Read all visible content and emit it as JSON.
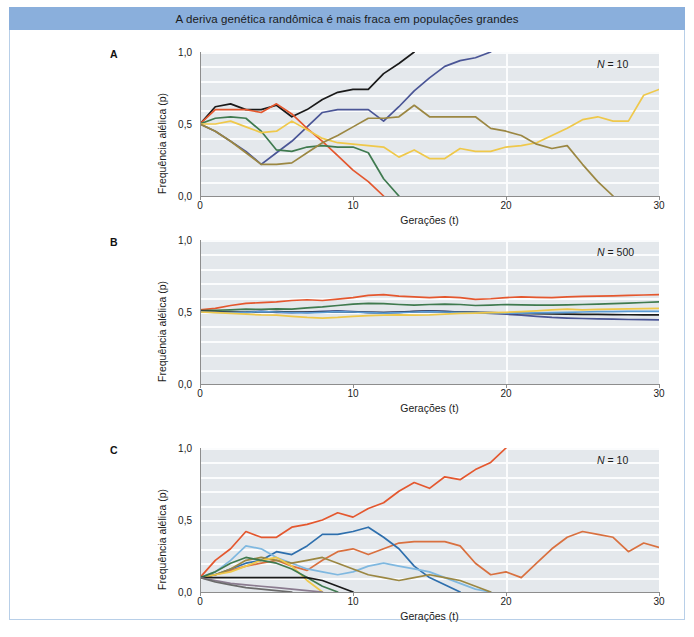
{
  "figure": {
    "title": "A deriva genética randômica é mais fraca em populações grandes",
    "title_bar_color": "#8aafdc",
    "frame_color": "#b8cfe8",
    "plot_background": "#e4e8ec",
    "gridline_color": "#fbfcfd"
  },
  "axis": {
    "xlabel": "Gerações (t)",
    "ylabel": "Frequência alélica (p)",
    "x_ticks": [
      "0",
      "10",
      "20",
      "30"
    ],
    "y_ticks": [
      "1,0",
      "0,5",
      "0,0"
    ],
    "xlim": [
      0,
      30
    ],
    "ylim": [
      0,
      1
    ]
  },
  "panels": [
    {
      "letter": "A",
      "n_label_prefix": "N",
      "n_label_eq": " = ",
      "n_label_value": "10",
      "start_frequency": 0.5
    },
    {
      "letter": "B",
      "n_label_prefix": "N",
      "n_label_eq": " = ",
      "n_label_value": "500",
      "start_frequency": 0.5
    },
    {
      "letter": "C",
      "n_label_prefix": "N",
      "n_label_eq": " = ",
      "n_label_value": "10",
      "start_frequency": 0.1
    }
  ],
  "chart_data": [
    {
      "type": "line",
      "panel": "A",
      "title": "",
      "xlabel": "Gerações (t)",
      "ylabel": "Frequência alélica (p)",
      "xlim": [
        0,
        30
      ],
      "ylim": [
        0,
        1
      ],
      "grid": true,
      "annotation": "N = 10",
      "x": [
        0,
        1,
        2,
        3,
        4,
        5,
        6,
        7,
        8,
        9,
        10,
        11,
        12,
        13,
        14,
        15,
        16,
        17,
        18,
        19,
        20,
        21,
        22,
        23,
        24,
        25,
        26,
        27,
        28,
        29,
        30
      ],
      "series": [
        {
          "name": "replicate-1",
          "color": "#1a1a1a",
          "values": [
            0.5,
            0.62,
            0.64,
            0.6,
            0.6,
            0.63,
            0.55,
            0.6,
            0.67,
            0.72,
            0.74,
            0.74,
            0.85,
            0.92,
            1.0,
            1.0,
            1.0,
            1.0,
            1.0,
            1.0,
            1.0,
            1.0,
            1.0,
            1.0,
            1.0,
            1.0,
            1.0,
            1.0,
            1.0,
            1.0,
            1.0
          ]
        },
        {
          "name": "replicate-2",
          "color": "#4a5596",
          "values": [
            0.5,
            0.45,
            0.38,
            0.31,
            0.22,
            0.3,
            0.38,
            0.48,
            0.58,
            0.6,
            0.6,
            0.6,
            0.52,
            0.62,
            0.73,
            0.82,
            0.9,
            0.94,
            0.96,
            1.0,
            1.0,
            1.0,
            1.0,
            1.0,
            1.0,
            1.0,
            1.0,
            1.0,
            1.0,
            1.0,
            1.0
          ]
        },
        {
          "name": "replicate-3",
          "color": "#e4572e",
          "values": [
            0.5,
            0.6,
            0.6,
            0.6,
            0.58,
            0.64,
            0.57,
            0.47,
            0.38,
            0.28,
            0.18,
            0.1,
            0.0,
            0.0,
            0.0,
            0.0,
            0.0,
            0.0,
            0.0,
            0.0,
            0.0,
            0.0,
            0.0,
            0.0,
            0.0,
            0.0,
            0.0,
            0.0,
            0.0,
            0.0,
            0.0
          ]
        },
        {
          "name": "replicate-4",
          "color": "#3f7a4f",
          "values": [
            0.5,
            0.54,
            0.55,
            0.54,
            0.45,
            0.32,
            0.31,
            0.34,
            0.35,
            0.34,
            0.34,
            0.3,
            0.12,
            0.0,
            0.0,
            0.0,
            0.0,
            0.0,
            0.0,
            0.0,
            0.0,
            0.0,
            0.0,
            0.0,
            0.0,
            0.0,
            0.0,
            0.0,
            0.0,
            0.0,
            0.0
          ]
        },
        {
          "name": "replicate-5",
          "color": "#efc84a",
          "values": [
            0.5,
            0.5,
            0.52,
            0.48,
            0.44,
            0.45,
            0.52,
            0.46,
            0.4,
            0.37,
            0.36,
            0.35,
            0.34,
            0.27,
            0.32,
            0.26,
            0.26,
            0.33,
            0.31,
            0.31,
            0.34,
            0.35,
            0.37,
            0.42,
            0.47,
            0.53,
            0.55,
            0.52,
            0.52,
            0.7,
            0.74
          ]
        },
        {
          "name": "replicate-6",
          "color": "#9b8742",
          "values": [
            0.5,
            0.45,
            0.38,
            0.3,
            0.22,
            0.22,
            0.23,
            0.3,
            0.37,
            0.42,
            0.48,
            0.54,
            0.54,
            0.55,
            0.63,
            0.55,
            0.55,
            0.55,
            0.55,
            0.47,
            0.45,
            0.42,
            0.36,
            0.33,
            0.35,
            0.22,
            0.1,
            0.0,
            0.0,
            0.0,
            0.0
          ]
        }
      ]
    },
    {
      "type": "line",
      "panel": "B",
      "title": "",
      "xlabel": "Gerações (t)",
      "ylabel": "Frequência alélica (p)",
      "xlim": [
        0,
        30
      ],
      "ylim": [
        0,
        1
      ],
      "grid": true,
      "annotation": "N = 500",
      "x": [
        0,
        1,
        2,
        3,
        4,
        5,
        6,
        7,
        8,
        9,
        10,
        11,
        12,
        13,
        14,
        15,
        16,
        17,
        18,
        19,
        20,
        21,
        22,
        23,
        24,
        25,
        26,
        27,
        28,
        29,
        30
      ],
      "series": [
        {
          "name": "replicate-1",
          "color": "#e4572e",
          "values": [
            0.515,
            0.525,
            0.545,
            0.56,
            0.565,
            0.57,
            0.58,
            0.585,
            0.58,
            0.59,
            0.6,
            0.615,
            0.62,
            0.61,
            0.605,
            0.6,
            0.605,
            0.6,
            0.588,
            0.592,
            0.6,
            0.605,
            0.602,
            0.6,
            0.605,
            0.608,
            0.61,
            0.612,
            0.615,
            0.618,
            0.62
          ]
        },
        {
          "name": "replicate-2",
          "color": "#3f7a4f",
          "values": [
            0.51,
            0.512,
            0.515,
            0.52,
            0.518,
            0.522,
            0.52,
            0.528,
            0.535,
            0.545,
            0.555,
            0.56,
            0.558,
            0.552,
            0.548,
            0.552,
            0.555,
            0.552,
            0.545,
            0.548,
            0.552,
            0.55,
            0.548,
            0.548,
            0.55,
            0.552,
            0.555,
            0.558,
            0.562,
            0.566,
            0.57
          ]
        },
        {
          "name": "replicate-3",
          "color": "#4a5596",
          "values": [
            0.505,
            0.5,
            0.498,
            0.5,
            0.505,
            0.498,
            0.495,
            0.5,
            0.505,
            0.508,
            0.502,
            0.498,
            0.495,
            0.5,
            0.505,
            0.508,
            0.505,
            0.5,
            0.495,
            0.49,
            0.485,
            0.478,
            0.47,
            0.462,
            0.458,
            0.455,
            0.452,
            0.45,
            0.448,
            0.447,
            0.446
          ]
        },
        {
          "name": "replicate-4",
          "color": "#1a1a1a",
          "values": [
            0.505,
            0.502,
            0.5,
            0.498,
            0.5,
            0.503,
            0.5,
            0.498,
            0.5,
            0.502,
            0.5,
            0.498,
            0.496,
            0.498,
            0.502,
            0.505,
            0.503,
            0.5,
            0.498,
            0.495,
            0.492,
            0.49,
            0.488,
            0.486,
            0.485,
            0.484,
            0.483,
            0.482,
            0.481,
            0.48,
            0.48
          ]
        },
        {
          "name": "replicate-5",
          "color": "#5b9bd5",
          "values": [
            0.5,
            0.498,
            0.496,
            0.498,
            0.502,
            0.5,
            0.496,
            0.494,
            0.498,
            0.502,
            0.5,
            0.496,
            0.492,
            0.495,
            0.5,
            0.502,
            0.5,
            0.498,
            0.496,
            0.494,
            0.492,
            0.492,
            0.494,
            0.496,
            0.498,
            0.5,
            0.502,
            0.503,
            0.504,
            0.505,
            0.505
          ]
        },
        {
          "name": "replicate-6",
          "color": "#efc84a",
          "values": [
            0.5,
            0.495,
            0.49,
            0.485,
            0.48,
            0.478,
            0.47,
            0.462,
            0.458,
            0.462,
            0.47,
            0.475,
            0.478,
            0.48,
            0.478,
            0.48,
            0.485,
            0.49,
            0.492,
            0.495,
            0.498,
            0.502,
            0.508,
            0.515,
            0.52,
            0.515,
            0.518,
            0.52,
            0.522,
            0.524,
            0.525
          ]
        }
      ]
    },
    {
      "type": "line",
      "panel": "C",
      "title": "",
      "xlabel": "Gerações (t)",
      "ylabel": "Frequência alélica (p)",
      "xlim": [
        0,
        30
      ],
      "ylim": [
        0,
        1
      ],
      "grid": true,
      "annotation": "N = 10",
      "x": [
        0,
        1,
        2,
        3,
        4,
        5,
        6,
        7,
        8,
        9,
        10,
        11,
        12,
        13,
        14,
        15,
        16,
        17,
        18,
        19,
        20,
        21,
        22,
        23,
        24,
        25,
        26,
        27,
        28,
        29,
        30
      ],
      "series": [
        {
          "name": "replicate-1",
          "color": "#e4572e",
          "values": [
            0.1,
            0.22,
            0.3,
            0.42,
            0.38,
            0.38,
            0.45,
            0.47,
            0.5,
            0.55,
            0.52,
            0.58,
            0.62,
            0.7,
            0.76,
            0.72,
            0.8,
            0.78,
            0.85,
            0.9,
            1.0,
            1.0,
            1.0,
            1.0,
            1.0,
            1.0,
            1.0,
            1.0,
            1.0,
            1.0,
            1.0
          ]
        },
        {
          "name": "replicate-2",
          "color": "#d9703f",
          "values": [
            0.1,
            0.12,
            0.15,
            0.18,
            0.2,
            0.22,
            0.18,
            0.15,
            0.22,
            0.28,
            0.3,
            0.26,
            0.3,
            0.34,
            0.35,
            0.35,
            0.35,
            0.32,
            0.2,
            0.12,
            0.14,
            0.1,
            0.2,
            0.3,
            0.38,
            0.42,
            0.4,
            0.38,
            0.28,
            0.34,
            0.31
          ]
        },
        {
          "name": "replicate-3",
          "color": "#2e6fad",
          "values": [
            0.1,
            0.12,
            0.16,
            0.2,
            0.22,
            0.28,
            0.26,
            0.32,
            0.4,
            0.4,
            0.42,
            0.45,
            0.38,
            0.3,
            0.18,
            0.1,
            0.05,
            0.0,
            0.0,
            0.0,
            0.0,
            0.0,
            0.0,
            0.0,
            0.0,
            0.0,
            0.0,
            0.0,
            0.0,
            0.0,
            0.0
          ]
        },
        {
          "name": "replicate-4",
          "color": "#7fb8e0",
          "values": [
            0.1,
            0.14,
            0.22,
            0.32,
            0.3,
            0.24,
            0.2,
            0.16,
            0.14,
            0.12,
            0.14,
            0.18,
            0.2,
            0.18,
            0.16,
            0.14,
            0.1,
            0.06,
            0.02,
            0.0,
            0.0,
            0.0,
            0.0,
            0.0,
            0.0,
            0.0,
            0.0,
            0.0,
            0.0,
            0.0,
            0.0
          ]
        },
        {
          "name": "replicate-5",
          "color": "#9b8742",
          "values": [
            0.1,
            0.12,
            0.16,
            0.22,
            0.24,
            0.22,
            0.2,
            0.22,
            0.24,
            0.2,
            0.16,
            0.12,
            0.1,
            0.08,
            0.1,
            0.12,
            0.1,
            0.08,
            0.04,
            0.0,
            0.0,
            0.0,
            0.0,
            0.0,
            0.0,
            0.0,
            0.0,
            0.0,
            0.0,
            0.0,
            0.0
          ]
        },
        {
          "name": "replicate-6",
          "color": "#efc84a",
          "values": [
            0.1,
            0.12,
            0.14,
            0.18,
            0.22,
            0.24,
            0.18,
            0.08,
            0.0,
            0.0,
            0.0,
            0.0,
            0.0,
            0.0,
            0.0,
            0.0,
            0.0,
            0.0,
            0.0,
            0.0,
            0.0,
            0.0,
            0.0,
            0.0,
            0.0,
            0.0,
            0.0,
            0.0,
            0.0,
            0.0,
            0.0
          ]
        },
        {
          "name": "replicate-7",
          "color": "#3f7a4f",
          "values": [
            0.1,
            0.14,
            0.2,
            0.24,
            0.22,
            0.2,
            0.16,
            0.1,
            0.04,
            0.0,
            0.0,
            0.0,
            0.0,
            0.0,
            0.0,
            0.0,
            0.0,
            0.0,
            0.0,
            0.0,
            0.0,
            0.0,
            0.0,
            0.0,
            0.0,
            0.0,
            0.0,
            0.0,
            0.0,
            0.0,
            0.0
          ]
        },
        {
          "name": "replicate-8",
          "color": "#1a1a1a",
          "values": [
            0.1,
            0.1,
            0.1,
            0.1,
            0.1,
            0.1,
            0.1,
            0.1,
            0.08,
            0.04,
            0.0,
            0.0,
            0.0,
            0.0,
            0.0,
            0.0,
            0.0,
            0.0,
            0.0,
            0.0,
            0.0,
            0.0,
            0.0,
            0.0,
            0.0,
            0.0,
            0.0,
            0.0,
            0.0,
            0.0,
            0.0
          ]
        },
        {
          "name": "replicate-9",
          "color": "#8a7b8f",
          "values": [
            0.1,
            0.08,
            0.06,
            0.05,
            0.04,
            0.03,
            0.02,
            0.01,
            0.0,
            0.0,
            0.0,
            0.0,
            0.0,
            0.0,
            0.0,
            0.0,
            0.0,
            0.0,
            0.0,
            0.0,
            0.0,
            0.0,
            0.0,
            0.0,
            0.0,
            0.0,
            0.0,
            0.0,
            0.0,
            0.0,
            0.0
          ]
        },
        {
          "name": "replicate-10",
          "color": "#6b6b6b",
          "values": [
            0.1,
            0.07,
            0.05,
            0.03,
            0.02,
            0.01,
            0.0,
            0.0,
            0.0,
            0.0,
            0.0,
            0.0,
            0.0,
            0.0,
            0.0,
            0.0,
            0.0,
            0.0,
            0.0,
            0.0,
            0.0,
            0.0,
            0.0,
            0.0,
            0.0,
            0.0,
            0.0,
            0.0,
            0.0,
            0.0,
            0.0
          ]
        }
      ]
    }
  ]
}
